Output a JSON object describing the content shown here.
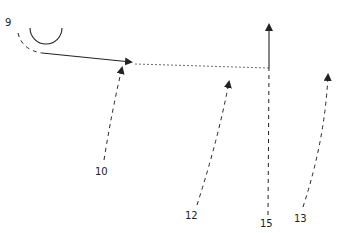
{
  "diagram": {
    "type": "play-diagram",
    "players": [
      {
        "label": "9",
        "x": 9,
        "y": 23
      },
      {
        "label": "10",
        "x": 97,
        "y": 173
      },
      {
        "label": "12",
        "x": 187,
        "y": 217
      },
      {
        "label": "15",
        "x": 262,
        "y": 226
      },
      {
        "label": "13",
        "x": 296,
        "y": 220
      }
    ],
    "elements": {
      "arc": "semicircle-screen",
      "routes": [
        {
          "player": "9",
          "style": "dashed-then-solid",
          "end": "arrow"
        },
        {
          "player": "10",
          "style": "dashed",
          "end": "arrow"
        },
        {
          "player": "12",
          "style": "dashed",
          "end": "arrow"
        },
        {
          "player": "15",
          "style": "dashed-then-solid",
          "end": "arrow"
        },
        {
          "player": "13",
          "style": "dashed",
          "end": "arrow"
        },
        {
          "player": "pass",
          "style": "dotted",
          "end": "none"
        }
      ]
    },
    "colors": {
      "ink": "#222222",
      "background": "#ffffff"
    }
  }
}
